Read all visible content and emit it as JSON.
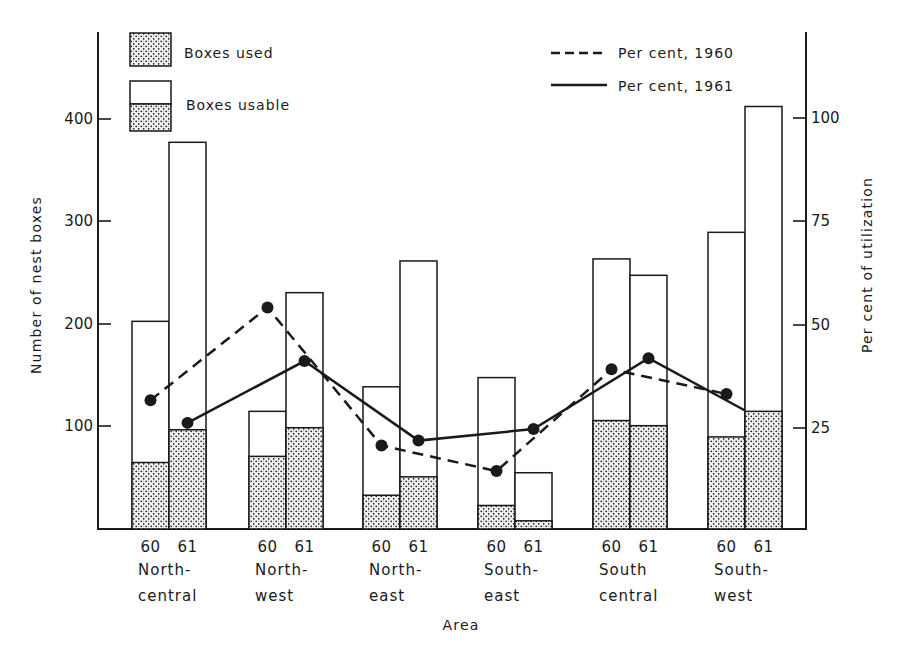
{
  "chart_data": {
    "type": "bar",
    "title": "",
    "xlabel": "Area",
    "ylabel": "Number of nest boxes",
    "y2label": "Per cent of utilization",
    "ylim": [
      0,
      450
    ],
    "y2lim": [
      0,
      100
    ],
    "yticks": [
      100,
      200,
      300,
      400
    ],
    "y2ticks": [
      25,
      50,
      75,
      100
    ],
    "grid": false,
    "legend_position": "top",
    "categories": [
      "North-central",
      "North-west",
      "North-east",
      "South-east",
      "South central",
      "South-west"
    ],
    "category_lines": [
      [
        "North-",
        "central"
      ],
      [
        "North-",
        "west"
      ],
      [
        "North-",
        "east"
      ],
      [
        "South-",
        "east"
      ],
      [
        "South",
        "central"
      ],
      [
        "South-",
        "west"
      ]
    ],
    "years": [
      "60",
      "61"
    ],
    "series": [
      {
        "name": "Boxes usable, 1960",
        "axis": "left",
        "values": [
          203,
          115,
          139,
          148,
          264,
          290
        ]
      },
      {
        "name": "Boxes used, 1960",
        "axis": "left",
        "values": [
          65,
          71,
          33,
          23,
          106,
          90
        ]
      },
      {
        "name": "Boxes usable, 1961",
        "axis": "left",
        "values": [
          378,
          231,
          262,
          55,
          248,
          413
        ]
      },
      {
        "name": "Boxes used, 1961",
        "axis": "left",
        "values": [
          97,
          99,
          51,
          8,
          101,
          115
        ]
      },
      {
        "name": "Per cent, 1960",
        "axis": "right",
        "type": "line",
        "style": "dashed",
        "values": [
          31.5,
          54,
          20.5,
          14.3,
          39,
          33
        ]
      },
      {
        "name": "Per cent, 1961",
        "axis": "right",
        "type": "line",
        "style": "solid",
        "values": [
          26,
          41,
          21.7,
          24.5,
          41.7,
          29
        ]
      }
    ],
    "legend": [
      {
        "label": "Boxes used",
        "swatch": "stippled"
      },
      {
        "label": "Boxes usable",
        "swatch": "open-over-stippled"
      },
      {
        "label": "Per cent, 1960",
        "swatch": "dashed-line"
      },
      {
        "label": "Per cent, 1961",
        "swatch": "solid-line"
      }
    ]
  },
  "labels": {
    "yaxis_title": "Number of nest boxes",
    "y2axis_title": "Per cent of utilization",
    "xaxis_title": "Area",
    "legend_used": "Boxes used",
    "legend_usable": "Boxes usable",
    "legend_1960": "Per cent, 1960",
    "legend_1961": "Per cent, 1961",
    "ytick_100": "100",
    "ytick_200": "200",
    "ytick_300": "300",
    "ytick_400": "400",
    "y2tick_25": "25",
    "y2tick_50": "50",
    "y2tick_75": "75",
    "y2tick_100": "100"
  },
  "colors": {
    "ink": "#1a1a1a",
    "paper": "#ffffff",
    "stipple_bg": "#f2f2f2"
  }
}
